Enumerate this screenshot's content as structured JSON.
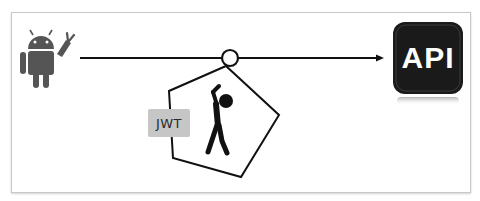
{
  "diagram": {
    "client": {
      "icon": "android-robot-icon",
      "color": "#555555"
    },
    "token": {
      "label": "JWT",
      "badge_color": "#c6c6c6"
    },
    "carrier": {
      "icon": "person-hanging-icon",
      "shape": "pentagon"
    },
    "server": {
      "label": "API",
      "icon": "api-icon",
      "tile_color": "#1a1a1a"
    },
    "connection": {
      "type": "arrow",
      "direction": "client-to-server"
    }
  }
}
